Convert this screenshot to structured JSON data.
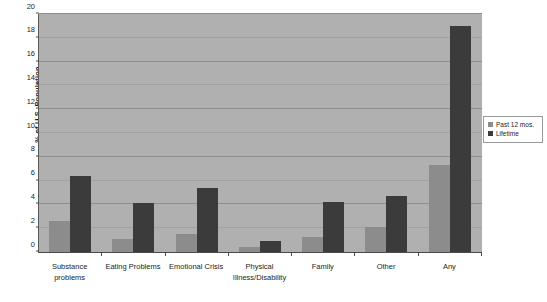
{
  "chart_data": {
    "type": "bar",
    "title": "",
    "xlabel": "",
    "ylabel": "% of U.S. Population",
    "ylim": [
      0,
      20
    ],
    "ytick_step": 2,
    "yticks": [
      0,
      2,
      4,
      6,
      8,
      10,
      12,
      14,
      16,
      18,
      20
    ],
    "ytick_labels": [
      "0",
      "2",
      "4",
      "6",
      "8",
      "10",
      "12",
      "14",
      "16",
      "18",
      "20"
    ],
    "grid": true,
    "grid_axis": "y",
    "legend_position": "right",
    "categories": [
      "Substance\nproblems",
      "Eating Problems",
      "Emotional Crisis",
      "Physical\nIllness/Disability",
      "Family",
      "Other",
      "Any"
    ],
    "series": [
      {
        "name": "Past 12 mos.",
        "color": "#8c8c8c",
        "values": [
          2.6,
          1.1,
          1.5,
          0.4,
          1.3,
          2.1,
          7.3
        ]
      },
      {
        "name": "Lifetime",
        "color": "#3b3b3b",
        "values": [
          6.4,
          4.1,
          5.4,
          0.9,
          4.2,
          4.7,
          19.0
        ]
      }
    ],
    "plot_background": "#b0b0b0",
    "figure_background": "#ffffff"
  },
  "legend": {
    "items": [
      {
        "label": "Past 12 mos."
      },
      {
        "label": "Lifetime"
      }
    ]
  }
}
